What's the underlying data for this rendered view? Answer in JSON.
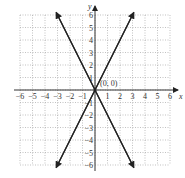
{
  "chart_data": {
    "type": "line",
    "title": "",
    "xlabel": "x",
    "ylabel": "y",
    "xlim": [
      -6,
      6
    ],
    "ylim": [
      -6,
      6
    ],
    "grid": true,
    "x_ticks": [
      -6,
      -5,
      -4,
      -3,
      -2,
      -1,
      1,
      2,
      3,
      4,
      5,
      6
    ],
    "y_ticks": [
      -6,
      -5,
      -4,
      -3,
      -2,
      -1,
      1,
      2,
      3,
      4,
      5,
      6
    ],
    "series": [
      {
        "name": "y = 2x",
        "points": [
          [
            -3.1,
            -6.2
          ],
          [
            0,
            0
          ],
          [
            3.1,
            6.2
          ]
        ]
      },
      {
        "name": "y = -2x",
        "points": [
          [
            -3.1,
            6.2
          ],
          [
            0,
            0
          ],
          [
            3.1,
            -6.2
          ]
        ]
      }
    ],
    "annotations": [
      {
        "text": "(0, 0)",
        "x": 0,
        "y": 0
      }
    ]
  },
  "labels": {
    "x_axis": "x",
    "y_axis": "y",
    "origin": "(0, 0)"
  }
}
